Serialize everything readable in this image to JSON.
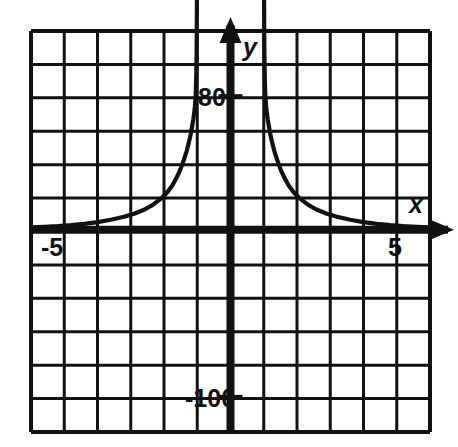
{
  "figure": {
    "title": "",
    "background_color": "#ffffff",
    "ink_color": "#111111"
  },
  "axes": {
    "x_axis_label": "x",
    "y_axis_label": "y",
    "x_arrow": "right-arrow",
    "y_arrow": "up-arrow",
    "x_tick_labels": [
      "-5",
      "5"
    ],
    "y_tick_labels": [
      "80",
      "-100"
    ]
  },
  "chart_data": {
    "type": "line",
    "title": "",
    "xlabel": "x",
    "ylabel": "y",
    "grid": true,
    "legend": null,
    "xlim": [
      -6,
      6
    ],
    "ylim": [
      -120,
      180
    ],
    "x_ticks": [
      -5,
      5
    ],
    "y_ticks": [
      80,
      -100
    ],
    "x_tick_labels": [
      "-5",
      "5"
    ],
    "y_tick_labels": [
      "80",
      "-100"
    ],
    "grid_columns": 12,
    "grid_rows": 12,
    "asymptotes": {
      "vertical": [
        -1,
        1
      ],
      "horizontal": [
        0
      ]
    },
    "series": [
      {
        "name": "left-branch",
        "points": [
          [
            -6.0,
            1.5
          ],
          [
            -5.6,
            1.8
          ],
          [
            -5.2,
            2.2
          ],
          [
            -4.8,
            2.8
          ],
          [
            -4.4,
            3.6
          ],
          [
            -4.0,
            4.6
          ],
          [
            -3.6,
            6.0
          ],
          [
            -3.2,
            7.8
          ],
          [
            -2.9,
            9.6
          ],
          [
            -2.6,
            12.0
          ],
          [
            -2.35,
            14.8
          ],
          [
            -2.1,
            18.5
          ],
          [
            -1.9,
            22.5
          ],
          [
            -1.75,
            26.5
          ],
          [
            -1.6,
            32.0
          ],
          [
            -1.5,
            36.5
          ],
          [
            -1.4,
            42.0
          ],
          [
            -1.32,
            47.0
          ],
          [
            -1.25,
            52.5
          ],
          [
            -1.2,
            57.0
          ],
          [
            -1.15,
            62.5
          ],
          [
            -1.12,
            66.0
          ],
          [
            -1.09,
            70.5
          ],
          [
            -1.07,
            74.0
          ],
          [
            -1.055,
            78.0
          ],
          [
            -1.045,
            82.0
          ],
          [
            -1.035,
            88.0
          ],
          [
            -1.028,
            95.0
          ],
          [
            -1.02,
            105.0
          ],
          [
            -1.014,
            120.0
          ],
          [
            -1.009,
            140.0
          ],
          [
            -1.006,
            160.0
          ],
          [
            -1.004,
            178.0
          ]
        ]
      },
      {
        "name": "right-branch",
        "points": [
          [
            1.004,
            178.0
          ],
          [
            1.006,
            160.0
          ],
          [
            1.009,
            140.0
          ],
          [
            1.014,
            120.0
          ],
          [
            1.02,
            105.0
          ],
          [
            1.028,
            95.0
          ],
          [
            1.035,
            88.0
          ],
          [
            1.045,
            82.0
          ],
          [
            1.055,
            78.0
          ],
          [
            1.07,
            74.0
          ],
          [
            1.09,
            70.5
          ],
          [
            1.12,
            66.0
          ],
          [
            1.15,
            62.5
          ],
          [
            1.2,
            57.0
          ],
          [
            1.25,
            52.5
          ],
          [
            1.32,
            47.0
          ],
          [
            1.4,
            42.0
          ],
          [
            1.5,
            36.5
          ],
          [
            1.6,
            32.0
          ],
          [
            1.75,
            26.5
          ],
          [
            1.9,
            22.5
          ],
          [
            2.1,
            18.5
          ],
          [
            2.35,
            14.8
          ],
          [
            2.6,
            12.0
          ],
          [
            2.9,
            9.6
          ],
          [
            3.2,
            7.8
          ],
          [
            3.6,
            6.0
          ],
          [
            4.0,
            4.6
          ],
          [
            4.4,
            3.6
          ],
          [
            4.8,
            2.8
          ],
          [
            5.2,
            2.2
          ],
          [
            5.6,
            1.8
          ],
          [
            6.0,
            1.5
          ]
        ]
      }
    ]
  }
}
